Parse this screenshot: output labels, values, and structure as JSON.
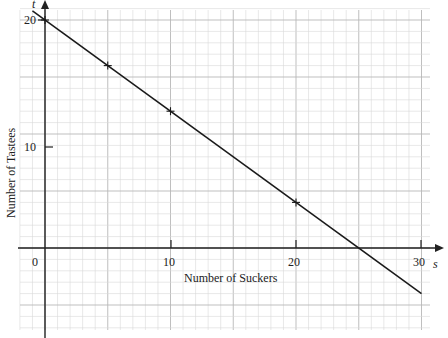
{
  "chart_data": {
    "type": "line",
    "title": "",
    "xlabel": "Number of Suckers",
    "ylabel": "Number of Tastees",
    "x_axis_symbol": "s",
    "y_axis_symbol": "t",
    "x_ticks": [
      0,
      10,
      20,
      30
    ],
    "y_ticks": [
      10,
      20
    ],
    "xlim": [
      -2,
      31
    ],
    "ylim": [
      -7.5,
      21.5
    ],
    "grid": true,
    "series": [
      {
        "name": "Tastees vs Suckers",
        "line": {
          "x": [
            -1,
            30
          ],
          "y": [
            20.8,
            -4
          ]
        },
        "marked_points": {
          "x": [
            0,
            5,
            10,
            20
          ],
          "y": [
            20,
            16,
            12,
            4
          ]
        }
      }
    ],
    "annotations": [
      {
        "text": "x-intercept at s = 25",
        "x": 25,
        "y": 0
      }
    ]
  },
  "labels": {
    "x_axis_title": "Number of Suckers",
    "y_axis_title": "Number of Tastees",
    "x_symbol": "s",
    "y_symbol": "t",
    "origin": "0",
    "x_tick_10": "10",
    "x_tick_20": "20",
    "x_tick_30": "30",
    "y_tick_10": "10",
    "y_tick_20": "20"
  },
  "colors": {
    "grid_minor": "#d8d8d8",
    "grid_major": "#b8b8b8",
    "axis": "#222222",
    "line": "#1a1a1a"
  }
}
